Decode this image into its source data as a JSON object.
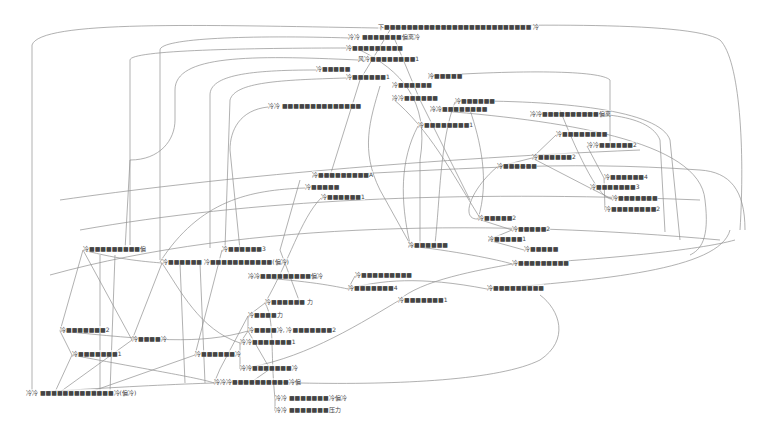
{
  "diagram": {
    "type": "network-graph",
    "edge_color": "#8a8a8a",
    "label_color": "#444444",
    "nodes": [
      {
        "id": "n1",
        "label": "下■■■■■■■■■■■■■■■■■■■■■■■■■■ 冷",
        "x": 378,
        "y": 26
      },
      {
        "id": "n2",
        "label": "冷冷 ■■■■■■■偏离冷",
        "x": 348,
        "y": 36
      },
      {
        "id": "n3",
        "label": "冷■■■■■■■■■",
        "x": 346,
        "y": 47
      },
      {
        "id": "n4",
        "label": "风冷■■■■■■■■1",
        "x": 358,
        "y": 58
      },
      {
        "id": "n5",
        "label": "冷■■■■■",
        "x": 316,
        "y": 68
      },
      {
        "id": "n6",
        "label": "冷■■■■■■1",
        "x": 346,
        "y": 76
      },
      {
        "id": "n7",
        "label": "冷■■■■■",
        "x": 428,
        "y": 75
      },
      {
        "id": "n8",
        "label": "冷冷 ■■■■■■■■■■■■■■",
        "x": 268,
        "y": 105
      },
      {
        "id": "n9",
        "label": "冷■■■■■■",
        "x": 392,
        "y": 84
      },
      {
        "id": "n10",
        "label": "冷冷■■■■■■",
        "x": 392,
        "y": 97
      },
      {
        "id": "n11",
        "label": "冷■■■■■■",
        "x": 455,
        "y": 100
      },
      {
        "id": "n12",
        "label": "冷冷■■■■■■■■",
        "x": 430,
        "y": 108
      },
      {
        "id": "n13",
        "label": "冷■■■■■■■■1",
        "x": 418,
        "y": 124
      },
      {
        "id": "n14",
        "label": "冷冷■■■■■■■■■■偏离",
        "x": 530,
        "y": 113
      },
      {
        "id": "n15",
        "label": "冷■■■■■■■■",
        "x": 556,
        "y": 133
      },
      {
        "id": "n16",
        "label": "冷冷■■■■■■2",
        "x": 587,
        "y": 144
      },
      {
        "id": "n17",
        "label": "冷■■■■■■2",
        "x": 532,
        "y": 156
      },
      {
        "id": "n18",
        "label": "冷■■■■■■",
        "x": 497,
        "y": 165
      },
      {
        "id": "n19",
        "label": "冷■■■■■■■■■A",
        "x": 312,
        "y": 174
      },
      {
        "id": "n20",
        "label": "冷■■■■■",
        "x": 305,
        "y": 186
      },
      {
        "id": "n21",
        "label": "冷■■■■■■1",
        "x": 321,
        "y": 196
      },
      {
        "id": "n22",
        "label": "冷■■■■■■4",
        "x": 604,
        "y": 176
      },
      {
        "id": "n23",
        "label": "冷■■■■■■■3",
        "x": 590,
        "y": 186
      },
      {
        "id": "n24",
        "label": "冷■■■■■■■",
        "x": 612,
        "y": 197
      },
      {
        "id": "n25",
        "label": "冷■■■■■■■■2",
        "x": 605,
        "y": 208
      },
      {
        "id": "n26",
        "label": "冷■■■■■2",
        "x": 478,
        "y": 217
      },
      {
        "id": "n27",
        "label": "冷■■■■■2",
        "x": 512,
        "y": 228
      },
      {
        "id": "n28",
        "label": "冷■■■■■1",
        "x": 488,
        "y": 238
      },
      {
        "id": "n29",
        "label": "冷■■■■■",
        "x": 524,
        "y": 248
      },
      {
        "id": "n30",
        "label": "冷■■■■■■",
        "x": 408,
        "y": 244
      },
      {
        "id": "n31",
        "label": "冷■■■■■■■■■",
        "x": 512,
        "y": 262
      },
      {
        "id": "n32",
        "label": "冷■■■■■■■■■",
        "x": 487,
        "y": 287
      },
      {
        "id": "n33",
        "label": "冷■■■■■■■1",
        "x": 398,
        "y": 299
      },
      {
        "id": "n34",
        "label": "冷■■■■■■■4",
        "x": 348,
        "y": 287
      },
      {
        "id": "n35",
        "label": "冷■■■■■■■■■",
        "x": 355,
        "y": 274
      },
      {
        "id": "n36",
        "label": "冷■■■■■■■■■偏",
        "x": 83,
        "y": 248
      },
      {
        "id": "n37",
        "label": "冷■■■■■■3",
        "x": 222,
        "y": 248
      },
      {
        "id": "n38",
        "label": "冷■■■■■■ 冷■■■■■■■■■■■(偏冷)",
        "x": 162,
        "y": 261
      },
      {
        "id": "n39",
        "label": "冷冷■■■■■■■■■偏冷",
        "x": 248,
        "y": 275
      },
      {
        "id": "n40",
        "label": "冷■■■■■■ 力",
        "x": 265,
        "y": 301
      },
      {
        "id": "n41",
        "label": "冷■■■■力",
        "x": 248,
        "y": 314
      },
      {
        "id": "n42",
        "label": "冷■■■■冷, 冷■■■■■■■2",
        "x": 248,
        "y": 329
      },
      {
        "id": "n43",
        "label": "冷冷■■■■■■■1",
        "x": 240,
        "y": 341
      },
      {
        "id": "n44",
        "label": "冷■■■■■■■2",
        "x": 60,
        "y": 329
      },
      {
        "id": "n45",
        "label": "冷■■■■冷",
        "x": 132,
        "y": 338
      },
      {
        "id": "n46",
        "label": "冷■■■■■■■1",
        "x": 72,
        "y": 353
      },
      {
        "id": "n47",
        "label": "冷■■■■■■冷",
        "x": 195,
        "y": 353
      },
      {
        "id": "n48",
        "label": "冷冷■■■■■■■冷",
        "x": 240,
        "y": 367
      },
      {
        "id": "n49",
        "label": "冷冷冷■■■■■■■■■■冷偏",
        "x": 214,
        "y": 381
      },
      {
        "id": "n50",
        "label": "冷冷 ■■■■■■■■■■■■■冷(偏冷)",
        "x": 26,
        "y": 392
      },
      {
        "id": "n51",
        "label": "冷冷 ■■■■■■■冷偏冷",
        "x": 275,
        "y": 397
      },
      {
        "id": "n52",
        "label": "冷冷 ■■■■■■■压力",
        "x": 275,
        "y": 409
      }
    ]
  }
}
